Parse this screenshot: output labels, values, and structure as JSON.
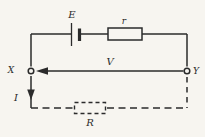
{
  "diagram": {
    "type": "circuit-diagram",
    "labels": {
      "emf": "E",
      "internal_resistance": "r",
      "terminal_voltage": "V",
      "terminal_left": "X",
      "terminal_right": "Y",
      "current": "I",
      "load_resistance": "R"
    },
    "colors": {
      "line": "#2b2b2b",
      "background": "#f7f5f0"
    }
  }
}
